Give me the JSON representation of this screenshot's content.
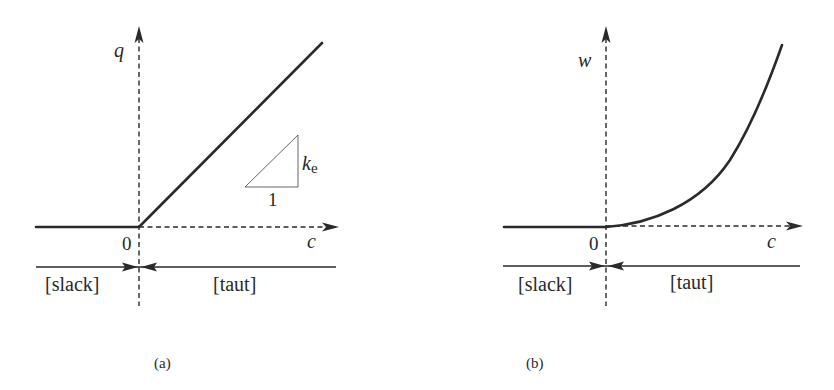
{
  "figure": {
    "panels": [
      {
        "id": "a",
        "caption": "(a)",
        "y_axis_label": "q",
        "x_axis_label": "c",
        "origin_label": "0",
        "region_left_label": "[slack]",
        "region_right_label": "[taut]",
        "curve_type": "piecewise-linear",
        "slope_triangle": {
          "run_label": "1",
          "rise_label_main": "k",
          "rise_label_sub": "e"
        }
      },
      {
        "id": "b",
        "caption": "(b)",
        "y_axis_label": "w",
        "x_axis_label": "c",
        "origin_label": "0",
        "region_left_label": "[slack]",
        "region_right_label": "[taut]",
        "curve_type": "piecewise-quadratic"
      }
    ],
    "colors": {
      "ink": "#2a2a2a",
      "triangle": "#555555",
      "background": "#ffffff"
    }
  }
}
